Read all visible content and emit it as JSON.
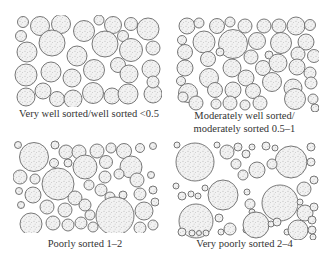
{
  "figure": {
    "panels": [
      {
        "id": "very-well-sorted",
        "caption_lines": [
          "Very well sorted/well sorted <0.5"
        ],
        "box": {
          "x": 14,
          "y": 15,
          "w": 148,
          "h": 92
        },
        "circles": [
          [
            9,
            7,
            5.5
          ],
          [
            26,
            11,
            9.5
          ],
          [
            47,
            9,
            9.5
          ],
          [
            70,
            16,
            10.5
          ],
          [
            85,
            5,
            5
          ],
          [
            99,
            10,
            8.5
          ],
          [
            117,
            9,
            6.5
          ],
          [
            134,
            14,
            11
          ],
          [
            7,
            21,
            5.5
          ],
          [
            109,
            21,
            5.5
          ],
          [
            13,
            37,
            10
          ],
          [
            38,
            28,
            13
          ],
          [
            63,
            41,
            10
          ],
          [
            91,
            29,
            13
          ],
          [
            117,
            35,
            11.5
          ],
          [
            139,
            33,
            7
          ],
          [
            12,
            60,
            11
          ],
          [
            37,
            57,
            10
          ],
          [
            58,
            63,
            9
          ],
          [
            80,
            55,
            10.5
          ],
          [
            104,
            50,
            7.5
          ],
          [
            115,
            59,
            9
          ],
          [
            137,
            54,
            9
          ],
          [
            12,
            82,
            9
          ],
          [
            29,
            76,
            8
          ],
          [
            43,
            84,
            7.5
          ],
          [
            59,
            84,
            9
          ],
          [
            79,
            78,
            10.5
          ],
          [
            98,
            81,
            8
          ],
          [
            114,
            79,
            10
          ],
          [
            139,
            79,
            9
          ],
          [
            139,
            67,
            6
          ]
        ]
      },
      {
        "id": "moderately-sorted",
        "caption_lines": [
          "Moderately well sorted/",
          "moderately sorted 0.5–1"
        ],
        "box": {
          "x": 175,
          "y": 15,
          "w": 144,
          "h": 97
        },
        "circles": [
          [
            12,
            11,
            8
          ],
          [
            24,
            8,
            5
          ],
          [
            42,
            11,
            7.5
          ],
          [
            55,
            7,
            5
          ],
          [
            70,
            11,
            7
          ],
          [
            89,
            11,
            7
          ],
          [
            104,
            11,
            7
          ],
          [
            121,
            11,
            9
          ],
          [
            135,
            10,
            5.5
          ],
          [
            7,
            25,
            4.5
          ],
          [
            29,
            27,
            11
          ],
          [
            58,
            29,
            14.5
          ],
          [
            82,
            26,
            8.5
          ],
          [
            106,
            28,
            10.5
          ],
          [
            131,
            27,
            8
          ],
          [
            10,
            37,
            7.5
          ],
          [
            33,
            44,
            7.5
          ],
          [
            45,
            37,
            4
          ],
          [
            76,
            42,
            7
          ],
          [
            94,
            40,
            4
          ],
          [
            123,
            39,
            7
          ],
          [
            139,
            41,
            6.5
          ],
          [
            10,
            53,
            8
          ],
          [
            34,
            63,
            9.5
          ],
          [
            57,
            53,
            9
          ],
          [
            71,
            63,
            8
          ],
          [
            88,
            53,
            7.5
          ],
          [
            103,
            48,
            9
          ],
          [
            122,
            52,
            8
          ],
          [
            135,
            58,
            6
          ],
          [
            6,
            66,
            4.5
          ],
          [
            13,
            78,
            9.5
          ],
          [
            40,
            75,
            7.5
          ],
          [
            58,
            75,
            8
          ],
          [
            78,
            76,
            7.5
          ],
          [
            97,
            67,
            9.5
          ],
          [
            118,
            73,
            9
          ],
          [
            136,
            68,
            6
          ],
          [
            8,
            82,
            5
          ],
          [
            21,
            88,
            7
          ],
          [
            41,
            89,
            5
          ],
          [
            55,
            88,
            7
          ],
          [
            70,
            90,
            5
          ],
          [
            85,
            88,
            7
          ],
          [
            120,
            84,
            10.5
          ],
          [
            138,
            84,
            5
          ],
          [
            140,
            93,
            4
          ]
        ]
      },
      {
        "id": "poorly-sorted",
        "caption_lines": [
          "Poorly sorted 1–2"
        ],
        "box": {
          "x": 13,
          "y": 140,
          "w": 146,
          "h": 93
        },
        "circles": [
          [
            5,
            5,
            3.5
          ],
          [
            21,
            17,
            14.5
          ],
          [
            42,
            5,
            4
          ],
          [
            53,
            12,
            7
          ],
          [
            66,
            12,
            7
          ],
          [
            84,
            11,
            7
          ],
          [
            98,
            8,
            5
          ],
          [
            111,
            11,
            7.5
          ],
          [
            127,
            8,
            4.5
          ],
          [
            140,
            6,
            3.5
          ],
          [
            41,
            23,
            4.5
          ],
          [
            55,
            23,
            4
          ],
          [
            72,
            27,
            12
          ],
          [
            93,
            22,
            6.5
          ],
          [
            118,
            27,
            11
          ],
          [
            7,
            37,
            7
          ],
          [
            22,
            39,
            5
          ],
          [
            45,
            44,
            16
          ],
          [
            92,
            37,
            6
          ],
          [
            106,
            34,
            5
          ],
          [
            124,
            40,
            7
          ],
          [
            138,
            35,
            3.5
          ],
          [
            76,
            45,
            5
          ],
          [
            88,
            50,
            6
          ],
          [
            97,
            57,
            5
          ],
          [
            110,
            55,
            4
          ],
          [
            127,
            54,
            6
          ],
          [
            140,
            50,
            4
          ],
          [
            6,
            51,
            3.5
          ],
          [
            20,
            55,
            8
          ],
          [
            62,
            58,
            7
          ],
          [
            72,
            65,
            6
          ],
          [
            8,
            65,
            3.5
          ],
          [
            34,
            67,
            7
          ],
          [
            52,
            70,
            7
          ],
          [
            77,
            75,
            5
          ],
          [
            102,
            76,
            19
          ],
          [
            131,
            71,
            9
          ],
          [
            142,
            62,
            4
          ],
          [
            18,
            84,
            11
          ],
          [
            40,
            83,
            7
          ],
          [
            55,
            85,
            6
          ],
          [
            68,
            83,
            6
          ],
          [
            80,
            87,
            5
          ],
          [
            127,
            88,
            6
          ],
          [
            140,
            85,
            5
          ]
        ]
      },
      {
        "id": "very-poorly-sorted",
        "caption_lines": [
          "Very poorly sorted 2–4"
        ],
        "box": {
          "x": 172,
          "y": 140,
          "w": 148,
          "h": 95
        },
        "circles": [
          [
            5,
            5,
            3
          ],
          [
            23,
            22,
            19
          ],
          [
            45,
            5,
            3
          ],
          [
            55,
            12,
            7
          ],
          [
            66,
            7,
            4
          ],
          [
            74,
            14,
            4
          ],
          [
            80,
            7,
            3
          ],
          [
            94,
            6,
            4
          ],
          [
            103,
            8,
            3
          ],
          [
            119,
            22,
            16
          ],
          [
            139,
            7,
            4
          ],
          [
            64,
            24,
            5
          ],
          [
            71,
            35,
            5
          ],
          [
            85,
            30,
            8
          ],
          [
            100,
            24,
            5
          ],
          [
            139,
            22,
            4
          ],
          [
            4,
            46,
            3
          ],
          [
            10,
            56,
            4
          ],
          [
            19,
            54,
            3
          ],
          [
            26,
            56,
            3
          ],
          [
            33,
            48,
            3
          ],
          [
            51,
            55,
            15
          ],
          [
            75,
            52,
            3
          ],
          [
            78,
            64,
            5
          ],
          [
            80,
            72,
            3
          ],
          [
            108,
            63,
            18
          ],
          [
            132,
            49,
            7
          ],
          [
            142,
            40,
            4
          ],
          [
            128,
            62,
            3
          ],
          [
            133,
            73,
            8
          ],
          [
            142,
            67,
            4
          ],
          [
            24,
            81,
            17
          ],
          [
            47,
            78,
            4
          ],
          [
            49,
            92,
            3
          ],
          [
            58,
            89,
            6
          ],
          [
            74,
            90,
            3
          ],
          [
            84,
            85,
            13
          ],
          [
            99,
            84,
            3
          ],
          [
            105,
            82,
            4
          ],
          [
            115,
            92,
            3
          ],
          [
            126,
            90,
            10
          ],
          [
            140,
            80,
            4
          ],
          [
            10,
            92,
            4
          ],
          [
            20,
            93,
            3
          ],
          [
            27,
            93,
            2.5
          ],
          [
            34,
            93,
            3
          ],
          [
            140,
            90,
            4
          ],
          [
            141,
            97,
            3
          ]
        ]
      }
    ]
  }
}
